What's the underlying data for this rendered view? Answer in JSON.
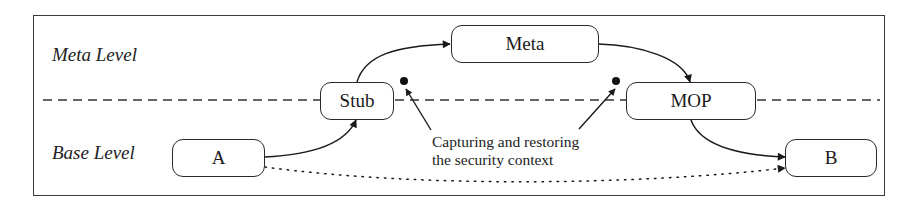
{
  "diagram": {
    "type": "meta-level architecture flow",
    "levels": {
      "meta": "Meta Level",
      "base": "Base Level"
    },
    "nodes": {
      "a": "A",
      "stub": "Stub",
      "meta": "Meta",
      "mop": "MOP",
      "b": "B"
    },
    "annotation": {
      "line1": "Capturing and restoring",
      "line2": "the security context"
    },
    "edges": [
      {
        "from": "A",
        "to": "Stub",
        "style": "solid"
      },
      {
        "from": "Stub",
        "to": "Meta",
        "style": "solid"
      },
      {
        "from": "Meta",
        "to": "MOP",
        "style": "solid"
      },
      {
        "from": "MOP",
        "to": "B",
        "style": "solid"
      },
      {
        "from": "A",
        "to": "B",
        "style": "dotted"
      }
    ],
    "separator": {
      "style": "dashed",
      "between": [
        "Meta Level",
        "Base Level"
      ]
    },
    "colors": {
      "stroke": "#2a2a2a",
      "background": "#ffffff"
    }
  }
}
